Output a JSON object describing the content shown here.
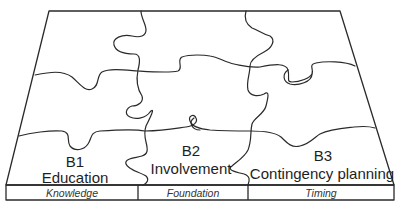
{
  "diagram": {
    "type": "jigsaw-puzzle-board",
    "grid": {
      "rows": 3,
      "columns": 3
    },
    "blocks": [
      {
        "code": "B1",
        "name": "Education",
        "base_label": "Knowledge"
      },
      {
        "code": "B2",
        "name": "Involvement",
        "base_label": "Foundation"
      },
      {
        "code": "B3",
        "name": "Contingency planning",
        "base_label": "Timing"
      }
    ],
    "colors": {
      "line": "#2a2a2a",
      "text": "#1e1e1e",
      "background": "#ffffff"
    }
  }
}
